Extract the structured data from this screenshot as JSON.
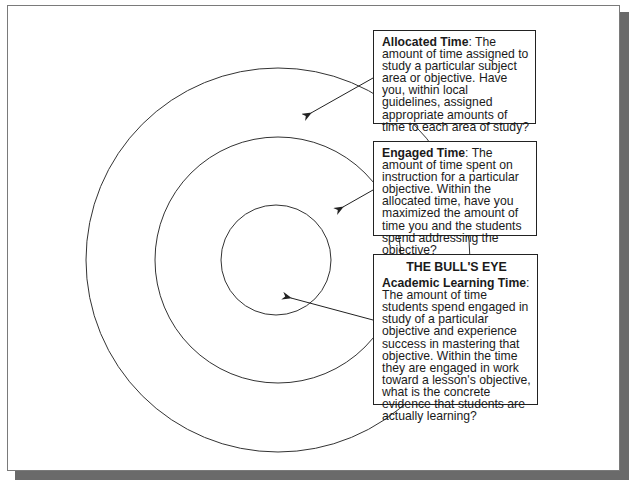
{
  "diagram": {
    "type": "concentric-target",
    "colors": {
      "line": "#333333",
      "box_border": "#222222",
      "text": "#1a1a1a",
      "frame_shadow": "#6a6a6a",
      "background": "#ffffff"
    },
    "rings": [
      {
        "id": "outer",
        "represents": "Allocated Time"
      },
      {
        "id": "middle",
        "represents": "Engaged Time"
      },
      {
        "id": "inner",
        "represents": "Academic Learning Time"
      }
    ]
  },
  "allocated": {
    "term": "Allocated Time",
    "description": ":  The amount of time assigned to study a particular subject area or objective. Have you, within local guidelines, assigned appropriate amounts of time to each area of study?"
  },
  "engaged": {
    "term": "Engaged Time",
    "description": ":  The amount of time spent on instruction for a particular objective. Within the allocated time, have you maximized the amount of time you and the students spend addressing the objective?"
  },
  "bullseye": {
    "title": "THE BULL'S EYE",
    "term": "Academic Learning Time",
    "description": ": The amount of time students spend engaged in study of a particular objective and experience success in mastering that objective. Within the time they are engaged in work toward a lesson's objective, what is the concrete evidence that students are actually learning?"
  }
}
